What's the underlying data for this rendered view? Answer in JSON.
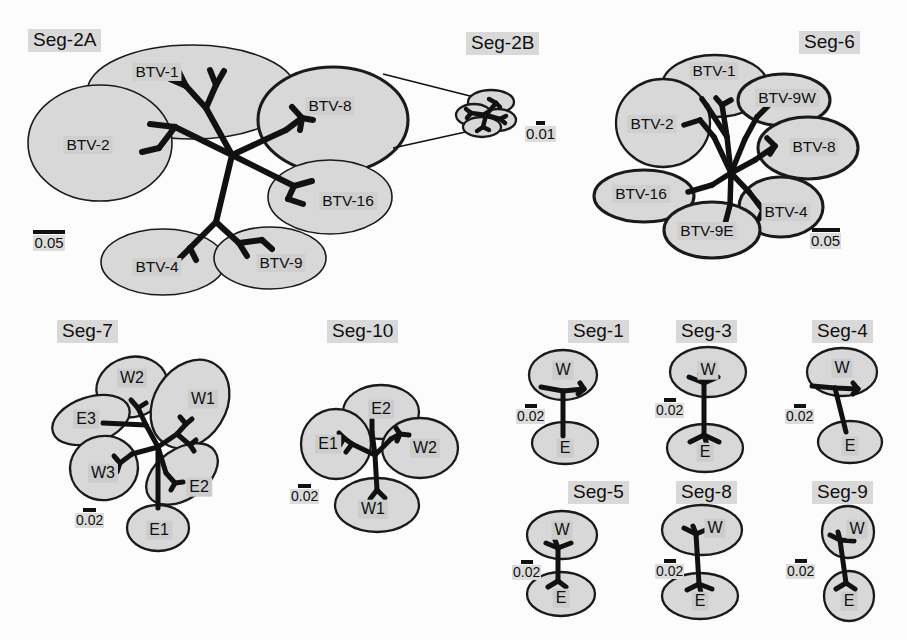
{
  "figure": {
    "kind": "phylogenetic-network-multipanel",
    "colors": {
      "ellipse_fill": "#d8d8d8",
      "ellipse_stroke": "#1a1a1a",
      "branch": "#111111",
      "label_highlight": "#cfcfcf",
      "title_highlight": "#d9d9d9",
      "background": "#fcfcfc"
    }
  },
  "panels": [
    {
      "id": "seg-2a",
      "title": "Seg-2A",
      "scale": "0.05",
      "clusters": [
        {
          "label": "BTV-1"
        },
        {
          "label": "BTV-2"
        },
        {
          "label": "BTV-8"
        },
        {
          "label": "BTV-16"
        },
        {
          "label": "BTV-4"
        },
        {
          "label": "BTV-9"
        }
      ]
    },
    {
      "id": "seg-2b",
      "title": "Seg-2B",
      "scale": "0.01",
      "clusters": []
    },
    {
      "id": "seg-6",
      "title": "Seg-6",
      "scale": "0.05",
      "clusters": [
        {
          "label": "BTV-1"
        },
        {
          "label": "BTV-2"
        },
        {
          "label": "BTV-9W"
        },
        {
          "label": "BTV-8"
        },
        {
          "label": "BTV-16"
        },
        {
          "label": "BTV-4"
        },
        {
          "label": "BTV-9E"
        }
      ]
    },
    {
      "id": "seg-7",
      "title": "Seg-7",
      "scale": "0.02",
      "clusters": [
        {
          "label": "W1"
        },
        {
          "label": "W2"
        },
        {
          "label": "W3"
        },
        {
          "label": "E1"
        },
        {
          "label": "E2"
        },
        {
          "label": "E3"
        }
      ]
    },
    {
      "id": "seg-10",
      "title": "Seg-10",
      "scale": "0.02",
      "clusters": [
        {
          "label": "E1"
        },
        {
          "label": "E2"
        },
        {
          "label": "W1"
        },
        {
          "label": "W2"
        }
      ]
    },
    {
      "id": "seg-1",
      "title": "Seg-1",
      "scale": "0.02",
      "clusters": [
        {
          "label": "W"
        },
        {
          "label": "E"
        }
      ]
    },
    {
      "id": "seg-3",
      "title": "Seg-3",
      "scale": "0.02",
      "clusters": [
        {
          "label": "W"
        },
        {
          "label": "E"
        }
      ]
    },
    {
      "id": "seg-4",
      "title": "Seg-4",
      "scale": "0.02",
      "clusters": [
        {
          "label": "W"
        },
        {
          "label": "E"
        }
      ]
    },
    {
      "id": "seg-5",
      "title": "Seg-5",
      "scale": "0.02",
      "clusters": [
        {
          "label": "W"
        },
        {
          "label": "E"
        }
      ]
    },
    {
      "id": "seg-8",
      "title": "Seg-8",
      "scale": "0.02",
      "clusters": [
        {
          "label": "W"
        },
        {
          "label": "E"
        }
      ]
    },
    {
      "id": "seg-9",
      "title": "Seg-9",
      "scale": "0.02",
      "clusters": [
        {
          "label": "W"
        },
        {
          "label": "E"
        }
      ]
    }
  ]
}
